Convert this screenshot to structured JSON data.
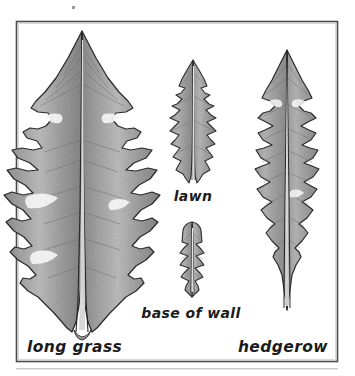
{
  "figure": {
    "medium": "pencil and ink botanical drawing",
    "frame": {
      "border_color": "#4a4a4a",
      "background_color": "#ffffff",
      "x": 16,
      "y": 21,
      "width": 322,
      "height": 341
    },
    "page_background": "#ffffff",
    "ink_color": "#1b1b1b",
    "leaf_fill_color": "#9a9a9a",
    "leaf_shadow_color": "#6f6f6f",
    "leaf_highlight_color": "#c8c8c8",
    "midrib_color": "#e8e8e8"
  },
  "labels": [
    {
      "id": "long-grass",
      "text": "long grass",
      "x": 27,
      "y": 352,
      "size": "big",
      "anchor": "start"
    },
    {
      "id": "lawn",
      "text": "lawn",
      "x": 193,
      "y": 201,
      "size": "mid",
      "anchor": "middle"
    },
    {
      "id": "base-of-wall",
      "text": "base of wall",
      "x": 191,
      "y": 318,
      "size": "mid",
      "anchor": "middle"
    },
    {
      "id": "hedgerow",
      "text": "hedgerow",
      "x": 328,
      "y": 352,
      "size": "big",
      "anchor": "end"
    }
  ],
  "leaves": [
    {
      "id": "long-grass-leaf",
      "habitat": "long grass",
      "description": "largest leaf, broad deeply-lobed blade with wide terminal lobe and large backward-pointing runcinate lobes",
      "tip_x": 82,
      "tip_y": 31,
      "base_x": 82,
      "base_y": 330,
      "max_width": 100,
      "lobe_pairs": 6
    },
    {
      "id": "lawn-leaf",
      "habitat": "lawn",
      "description": "narrow small leaf with shallow close-set serrations, prostrate lawn form",
      "tip_x": 193,
      "tip_y": 60,
      "base_x": 193,
      "base_y": 183,
      "max_width": 28,
      "lobe_pairs": 7
    },
    {
      "id": "base-of-wall-leaf",
      "habitat": "base of wall",
      "description": "shortest leaf, blunt rounded tip with small sharp teeth along the lower margin",
      "tip_x": 192,
      "tip_y": 222,
      "base_x": 192,
      "base_y": 297,
      "max_width": 24,
      "lobe_pairs": 5
    },
    {
      "id": "hedgerow-leaf",
      "habitat": "hedgerow",
      "description": "tall narrow leaf with pointed terminal lobe and regular sharply toothed lobes",
      "tip_x": 287,
      "tip_y": 50,
      "base_x": 287,
      "base_y": 310,
      "max_width": 62,
      "lobe_pairs": 6
    }
  ],
  "marks": [
    {
      "id": "speck-top",
      "x": 72,
      "y": 6,
      "w": 3,
      "h": 3
    }
  ]
}
